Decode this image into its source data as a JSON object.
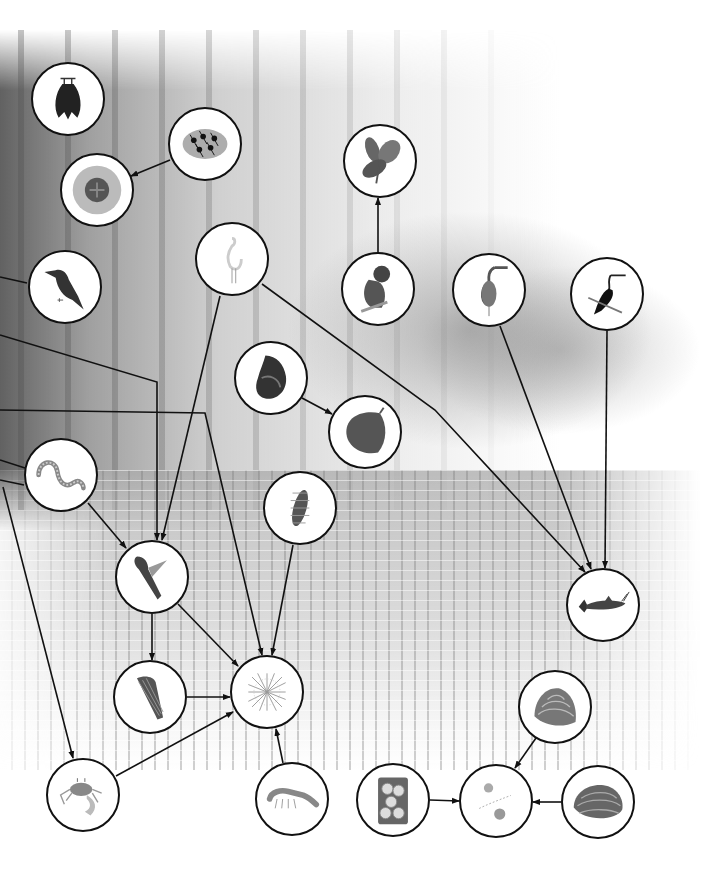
{
  "diagram": {
    "type": "food-web",
    "setting": "mangrove forest",
    "arrow_convention": "arrow points from consumer to food source",
    "nodes": [
      {
        "id": "bat",
        "label": "Fruit bat",
        "x": 68,
        "y": 99,
        "r": 37
      },
      {
        "id": "ants",
        "label": "Weaver ants",
        "x": 205,
        "y": 144,
        "r": 37
      },
      {
        "id": "nest",
        "label": "Ant nest",
        "x": 97,
        "y": 190,
        "r": 37
      },
      {
        "id": "kingfisher",
        "label": "Kingfisher",
        "x": 65,
        "y": 287,
        "r": 37
      },
      {
        "id": "egret",
        "label": "Egret",
        "x": 232,
        "y": 259,
        "r": 37
      },
      {
        "id": "leaves",
        "label": "Mangrove leaves",
        "x": 380,
        "y": 161,
        "r": 37
      },
      {
        "id": "monkey",
        "label": "Proboscis monkey",
        "x": 378,
        "y": 289,
        "r": 37
      },
      {
        "id": "heron",
        "label": "Heron",
        "x": 489,
        "y": 290,
        "r": 37
      },
      {
        "id": "darter",
        "label": "Darter",
        "x": 607,
        "y": 294,
        "r": 37
      },
      {
        "id": "snail",
        "label": "Mangrove snail",
        "x": 271,
        "y": 378,
        "r": 37
      },
      {
        "id": "leaf_litter",
        "label": "Leaf litter",
        "x": 365,
        "y": 432,
        "r": 37
      },
      {
        "id": "worm",
        "label": "Polychaete worm",
        "x": 61,
        "y": 475,
        "r": 37
      },
      {
        "id": "larva",
        "label": "Insect larva",
        "x": 300,
        "y": 508,
        "r": 37
      },
      {
        "id": "mudskipper",
        "label": "Mudskipper",
        "x": 152,
        "y": 577,
        "r": 37
      },
      {
        "id": "catfish",
        "label": "Catfish",
        "x": 603,
        "y": 605,
        "r": 37
      },
      {
        "id": "cone_shell",
        "label": "Mud creeper snail",
        "x": 150,
        "y": 697,
        "r": 37
      },
      {
        "id": "detritus",
        "label": "Detritus",
        "x": 267,
        "y": 692,
        "r": 37
      },
      {
        "id": "crab",
        "label": "Fiddler crab",
        "x": 83,
        "y": 795,
        "r": 37
      },
      {
        "id": "shrimp",
        "label": "Shrimp",
        "x": 292,
        "y": 799,
        "r": 37
      },
      {
        "id": "clam_top",
        "label": "Clam",
        "x": 555,
        "y": 707,
        "r": 37
      },
      {
        "id": "oyster",
        "label": "Oysters",
        "x": 393,
        "y": 800,
        "r": 37
      },
      {
        "id": "plankton",
        "label": "Plankton",
        "x": 496,
        "y": 801,
        "r": 37
      },
      {
        "id": "clam_right",
        "label": "Cockle",
        "x": 598,
        "y": 802,
        "r": 37
      }
    ],
    "edges": [
      {
        "from": "ants",
        "to": "nest",
        "points": [
          [
            170,
            160
          ],
          [
            131,
            176
          ]
        ]
      },
      {
        "from": "monkey",
        "to": "leaves",
        "points": [
          [
            378,
            252
          ],
          [
            378,
            198
          ]
        ]
      },
      {
        "from": "snail",
        "to": "leaf_litter",
        "points": [
          [
            302,
            398
          ],
          [
            332,
            414
          ]
        ]
      },
      {
        "from": "egret",
        "to": "mudskipper",
        "points": [
          [
            220,
            296
          ],
          [
            162,
            540
          ]
        ]
      },
      {
        "from": "egret",
        "to": "catfish",
        "points": [
          [
            262,
            284
          ],
          [
            435,
            410
          ],
          [
            585,
            572
          ]
        ]
      },
      {
        "from": "heron",
        "to": "catfish",
        "points": [
          [
            500,
            326
          ],
          [
            591,
            569
          ]
        ]
      },
      {
        "from": "darter",
        "to": "catfish",
        "points": [
          [
            607,
            331
          ],
          [
            605,
            568
          ]
        ]
      },
      {
        "from": "offscreen_left_a",
        "to": "mudskipper",
        "points": [
          [
            0,
            335
          ],
          [
            157,
            382
          ],
          [
            157,
            540
          ]
        ]
      },
      {
        "from": "offscreen_left_b",
        "to": "detritus",
        "points": [
          [
            0,
            410
          ],
          [
            205,
            413
          ],
          [
            262,
            655
          ]
        ]
      },
      {
        "from": "offscreen_left_c",
        "to": "crab",
        "points": [
          [
            3,
            487
          ],
          [
            73,
            758
          ]
        ]
      },
      {
        "from": "worm",
        "to": "mudskipper",
        "points": [
          [
            88,
            503
          ],
          [
            126,
            548
          ]
        ]
      },
      {
        "from": "larva",
        "to": "detritus",
        "points": [
          [
            293,
            545
          ],
          [
            272,
            655
          ]
        ]
      },
      {
        "from": "mudskipper",
        "to": "cone_shell",
        "points": [
          [
            152,
            614
          ],
          [
            152,
            660
          ]
        ]
      },
      {
        "from": "mudskipper",
        "to": "detritus",
        "points": [
          [
            178,
            604
          ],
          [
            238,
            666
          ]
        ]
      },
      {
        "from": "cone_shell",
        "to": "detritus",
        "points": [
          [
            187,
            697
          ],
          [
            230,
            697
          ]
        ]
      },
      {
        "from": "crab",
        "to": "detritus",
        "points": [
          [
            116,
            776
          ],
          [
            233,
            712
          ]
        ]
      },
      {
        "from": "shrimp",
        "to": "detritus",
        "points": [
          [
            283,
            763
          ],
          [
            276,
            729
          ]
        ]
      },
      {
        "from": "clam_top",
        "to": "plankton",
        "points": [
          [
            536,
            738
          ],
          [
            515,
            768
          ]
        ]
      },
      {
        "from": "oyster",
        "to": "plankton",
        "points": [
          [
            430,
            800
          ],
          [
            459,
            801
          ]
        ]
      },
      {
        "from": "clam_right",
        "to": "plankton",
        "points": [
          [
            561,
            802
          ],
          [
            533,
            802
          ]
        ]
      }
    ],
    "offscreen_left_lines": [
      {
        "points": [
          [
            0,
            277
          ],
          [
            27,
            283
          ]
        ]
      },
      {
        "points": [
          [
            0,
            460
          ],
          [
            25,
            468
          ]
        ]
      },
      {
        "points": [
          [
            0,
            480
          ],
          [
            24,
            485
          ]
        ]
      }
    ]
  },
  "colors": {
    "stroke": "#111111",
    "node_fill": "#ffffff",
    "background": "#ffffff"
  }
}
